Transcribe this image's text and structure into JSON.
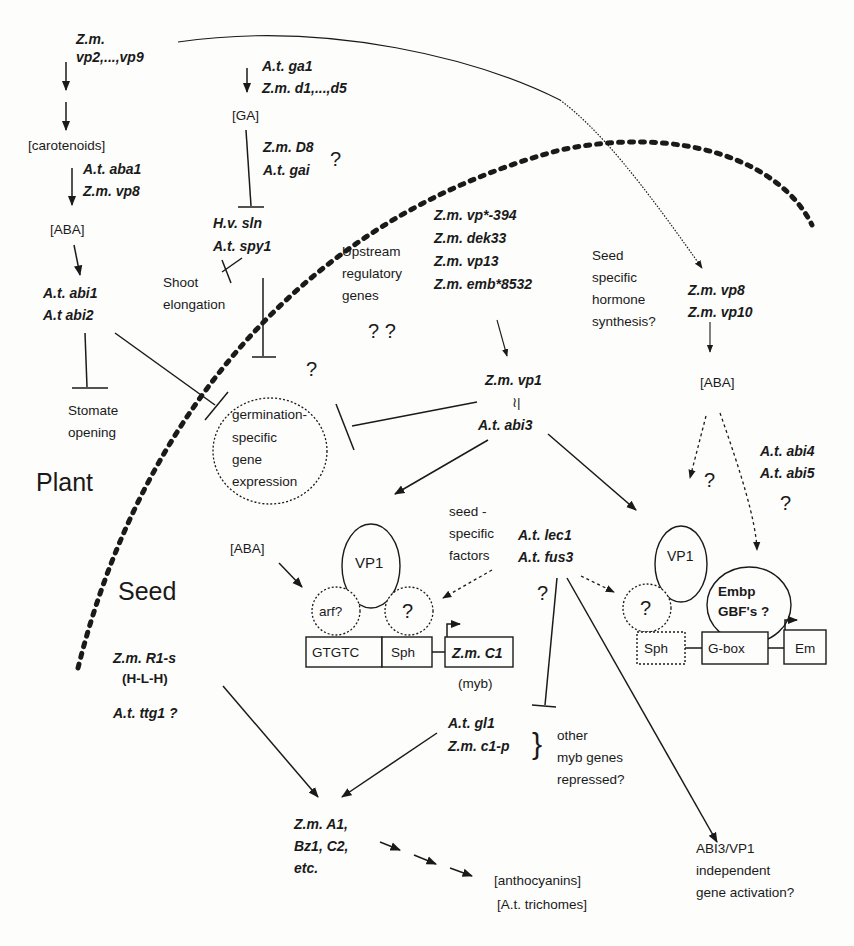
{
  "regions": {
    "plant": "Plant",
    "seed": "Seed"
  },
  "carotenoid_pathway": {
    "genes_line1": "Z.m.",
    "genes_line2": "vp2,...,vp9",
    "carotenoids": "[carotenoids]",
    "aba_genes_1": "A.t. aba1",
    "aba_genes_2": "Z.m. vp8",
    "aba": "[ABA]",
    "abi_1": "A.t. abi1",
    "abi_2": "A.t abi2",
    "stomate_1": "Stomate",
    "stomate_2": "opening"
  },
  "ga_pathway": {
    "genes_1": "A.t. ga1",
    "genes_2": "Z.m. d1,...,d5",
    "ga": "[GA]",
    "d8_1": "Z.m. D8",
    "d8_2": "A.t. gai",
    "d8_q": "?",
    "sln_1": "H.v. sln",
    "sln_2": "A.t. spy1",
    "shoot_1": "Shoot",
    "shoot_2": "elongation"
  },
  "germination": {
    "q": "?",
    "line1": "germination-",
    "line2": "specific",
    "line3": "gene",
    "line4": "expression"
  },
  "upstream": {
    "line1": "Upstream",
    "line2": "regulatory",
    "line3": "genes",
    "q": "? ?",
    "genes": [
      "Z.m. vp*-394",
      "Z.m. dek33",
      "Z.m. vp13",
      "Z.m. emb*8532"
    ]
  },
  "core": {
    "vp1": "Z.m. vp1",
    "equiv": "≀|",
    "abi3": "A.t. abi3"
  },
  "seed_hormone": {
    "line1": "Seed",
    "line2": "specific",
    "line3": "hormone",
    "line4": "synthesis?",
    "genes_1": "Z.m. vp8",
    "genes_2": "Z.m. vp10",
    "aba": "[ABA]",
    "q1": "?",
    "abi4": "A.t. abi4",
    "abi5": "A.t. abi5",
    "q2": "?"
  },
  "c1_promoter": {
    "aba": "[ABA]",
    "vp1": "VP1",
    "arf": "arf?",
    "q": "?",
    "seed_factors_1": "seed -",
    "seed_factors_2": "specific",
    "seed_factors_3": "factors",
    "gtgtc": "GTGTC",
    "sph": "Sph",
    "c1": "Z.m. C1",
    "myb": "(myb)"
  },
  "lec": {
    "lec1": "A.t. lec1",
    "fus3": "A.t. fus3",
    "q": "?"
  },
  "em_promoter": {
    "vp1": "VP1",
    "q": "?",
    "embp_1": "Embp",
    "embp_2": "GBF's ?",
    "sph": "Sph",
    "gbox": "G-box",
    "em": "Em"
  },
  "anthocyanin": {
    "r1": "Z.m. R1-s",
    "hlh": "(H-L-H)",
    "ttg": "A.t. ttg1  ?",
    "gl1": "A.t. gl1",
    "c1p": "Z.m. c1-p",
    "other_1": "other",
    "other_2": "myb genes",
    "other_3": "repressed?",
    "targets_1": "Z.m. A1,",
    "targets_2": "Bz1, C2,",
    "targets_3": "etc.",
    "product_1": "[anthocyanins]",
    "product_2": "[A.t. trichomes]"
  },
  "independent": {
    "line1": "ABI3/VP1",
    "line2": "independent",
    "line3": "gene activation?"
  }
}
